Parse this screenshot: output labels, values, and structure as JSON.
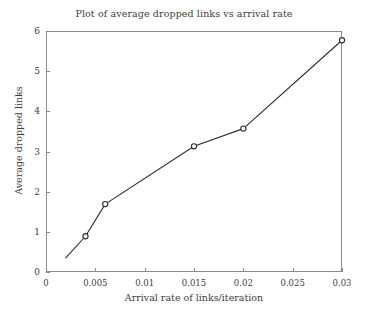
{
  "chart_data": {
    "type": "line",
    "title": "Plot of average dropped links vs arrival rate",
    "xlabel": "Arrival rate of links/iteration",
    "ylabel": "Average dropped links",
    "x": [
      0.002,
      0.004,
      0.006,
      0.015,
      0.02,
      0.03
    ],
    "values": [
      0.35,
      0.89,
      1.69,
      3.13,
      3.57,
      5.77
    ],
    "series": [
      {
        "name": "Average dropped links",
        "x": [
          0.002,
          0.004,
          0.006,
          0.015,
          0.02,
          0.03
        ],
        "values": [
          0.35,
          0.89,
          1.69,
          3.13,
          3.57,
          5.77
        ],
        "marker": "circle",
        "markers_shown": [
          false,
          true,
          true,
          true,
          true,
          true
        ],
        "color": "#2b2b2b"
      }
    ],
    "xlim": [
      0,
      0.03
    ],
    "ylim": [
      0,
      6
    ],
    "xticks": [
      0,
      0.005,
      0.01,
      0.015,
      0.02,
      0.025,
      0.03
    ],
    "xtick_labels": [
      "0",
      "0.005",
      "0.01",
      "0.015",
      "0.02",
      "0.025",
      "0.03"
    ],
    "yticks": [
      0,
      1,
      2,
      3,
      4,
      5,
      6
    ],
    "ytick_labels": [
      "0",
      "1",
      "2",
      "3",
      "4",
      "5",
      "6"
    ],
    "grid": false,
    "legend": null,
    "legend_position": "none",
    "frame": "box",
    "background_color": "#ffffff",
    "axis_color": "#8a8a8a",
    "text_color": "#3d3d3d"
  }
}
